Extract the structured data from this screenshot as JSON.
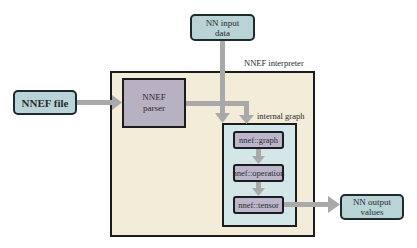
{
  "diagram": {
    "nodes": {
      "nnef_file": {
        "label": "NNEF file"
      },
      "nn_input": {
        "line1": "NN input",
        "line2": "data"
      },
      "interpreter": {
        "label": "NNEF interpreter"
      },
      "parser": {
        "line1": "NNEF",
        "line2": "parser"
      },
      "internal_graph": {
        "label": "internal graph"
      },
      "graph": {
        "label": "nnef::graph"
      },
      "operation": {
        "label": "nnef::operation"
      },
      "tensor": {
        "label": "nnef::tensor"
      },
      "nn_output": {
        "line1": "NN output",
        "line2": "values"
      }
    },
    "edges": [
      {
        "from": "NNEF file",
        "to": "NNEF parser"
      },
      {
        "from": "NN input data",
        "to": "internal graph"
      },
      {
        "from": "NNEF parser",
        "to": "internal graph"
      },
      {
        "from": "nnef::graph",
        "to": "nnef::operation"
      },
      {
        "from": "nnef::operation",
        "to": "nnef::tensor"
      },
      {
        "from": "nnef::tensor",
        "to": "NN output values"
      }
    ],
    "colors": {
      "io_box": "#b9d4d6",
      "interpreter_bg": "#f3ecd8",
      "parser_bg": "#b8b1c2",
      "graph_bg": "#d3e6e8",
      "node_bg": "#bcb6cc",
      "arrow": "#a9a9a9"
    }
  }
}
